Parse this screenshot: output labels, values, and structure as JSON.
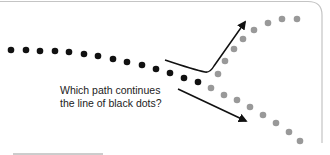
{
  "figure": {
    "caption_lines": [
      "Which path continues",
      "the line of black dots?"
    ],
    "colors": {
      "black_dot": "#111111",
      "gray_dot": "#999999",
      "arrow": "#111111",
      "frame": "#bdbdbd"
    },
    "black_dots": [
      [
        11,
        50
      ],
      [
        26,
        50
      ],
      [
        40,
        51
      ],
      [
        55,
        51
      ],
      [
        69,
        52
      ],
      [
        84,
        54
      ],
      [
        98,
        56
      ],
      [
        113,
        59
      ],
      [
        127,
        62
      ],
      [
        142,
        65
      ],
      [
        156,
        69
      ],
      [
        170,
        73
      ],
      [
        184,
        78
      ],
      [
        198,
        82
      ]
    ],
    "upper_gray_dots": [
      [
        218,
        74
      ],
      [
        225,
        61
      ],
      [
        234,
        49
      ],
      [
        243,
        39
      ],
      [
        254,
        30
      ],
      [
        268,
        23
      ],
      [
        282,
        19
      ],
      [
        297,
        19
      ]
    ],
    "lower_gray_dots": [
      [
        211,
        88
      ],
      [
        224,
        95
      ],
      [
        237,
        100
      ],
      [
        250,
        107
      ],
      [
        263,
        115
      ],
      [
        276,
        123
      ],
      [
        289,
        132
      ],
      [
        300,
        141
      ]
    ],
    "arrows": [
      {
        "name": "upper-path-arrow",
        "path": "M165,60 Q195,70 205,72 Q210,73 214,66 L245,22"
      },
      {
        "name": "lower-path-arrow",
        "path": "M178,89 L246,121"
      }
    ]
  }
}
